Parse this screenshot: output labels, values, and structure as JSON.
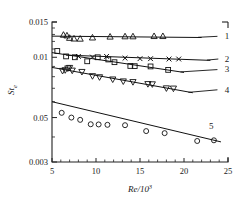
{
  "chart_data": {
    "type": "scatter",
    "title": "",
    "xlabel": "Re/10³",
    "ylabel": "St",
    "ylabel_sub": "e",
    "xlabel_base": "Re/10",
    "xlabel_exp": "3",
    "xscale": "linear",
    "yscale": "log",
    "xlim": [
      5,
      25
    ],
    "ylim": [
      0.003,
      0.015
    ],
    "grid": false,
    "legend_position": "right-inline",
    "xticks": [
      5,
      10,
      15,
      20,
      25
    ],
    "xtick_labels": [
      "5",
      "10",
      "15",
      "20",
      "25"
    ],
    "yticks": [
      0.015,
      0.01,
      0.05,
      0.003
    ],
    "ytick_labels": [
      "0.015",
      "0.01",
      "0.05",
      "0.003"
    ],
    "ytick_values": [
      0.015,
      0.01,
      0.005,
      0.003
    ],
    "yticks_minor": [
      0.014,
      0.013,
      0.012,
      0.011,
      0.009,
      0.008,
      0.007,
      0.006,
      0.004
    ],
    "series": [
      {
        "name": "1",
        "label": "1",
        "marker": "triangle-up",
        "label_x": 24.4,
        "label_y": 0.0128,
        "fit": [
          [
            5.0,
            0.01275
          ],
          [
            22.0,
            0.01255
          ]
        ],
        "leader": [
          [
            21.6,
            0.01258
          ],
          [
            23.8,
            0.01272
          ]
        ],
        "points": [
          [
            6.3,
            0.01295
          ],
          [
            6.7,
            0.01285
          ],
          [
            7.0,
            0.0125
          ],
          [
            7.5,
            0.0124
          ],
          [
            8.2,
            0.01238
          ],
          [
            9.6,
            0.01255
          ],
          [
            11.6,
            0.01268
          ],
          [
            13.3,
            0.01272
          ],
          [
            14.2,
            0.01272
          ],
          [
            16.6,
            0.01276
          ],
          [
            17.6,
            0.01276
          ]
        ]
      },
      {
        "name": "2",
        "label": "2",
        "marker": "cross",
        "label_x": 24.4,
        "label_y": 0.00985,
        "fit": [
          [
            6.6,
            0.01025
          ],
          [
            23.0,
            0.00965
          ]
        ],
        "leader": [
          [
            22.6,
            0.00968
          ],
          [
            23.9,
            0.0098
          ]
        ],
        "points": [
          [
            8.0,
            0.0101
          ],
          [
            9.6,
            0.01002
          ],
          [
            11.2,
            0.0101
          ],
          [
            13.3,
            0.0099
          ],
          [
            15.0,
            0.00984
          ],
          [
            16.2,
            0.00984
          ],
          [
            18.3,
            0.0098
          ],
          [
            19.4,
            0.0098
          ]
        ]
      },
      {
        "name": "3",
        "label": "3",
        "marker": "square",
        "label_x": 24.4,
        "label_y": 0.0087,
        "fit": [
          [
            5.0,
            0.01055
          ],
          [
            20.0,
            0.0084
          ]
        ],
        "leader": [
          [
            19.6,
            0.00845
          ],
          [
            23.8,
            0.00868
          ]
        ],
        "points": [
          [
            5.6,
            0.01075
          ],
          [
            6.6,
            0.0101
          ],
          [
            7.6,
            0.01
          ],
          [
            9.0,
            0.00955
          ],
          [
            10.2,
            0.01
          ],
          [
            11.4,
            0.00975
          ],
          [
            12.1,
            0.00945
          ],
          [
            13.9,
            0.00905
          ],
          [
            14.4,
            0.00903
          ],
          [
            16.2,
            0.009
          ],
          [
            18.2,
            0.00865
          ]
        ]
      },
      {
        "name": "4",
        "label": "4",
        "marker": "triangle-down",
        "label_x": 24.4,
        "label_y": 0.0069,
        "fit": [
          [
            5.0,
            0.0089
          ],
          [
            21.0,
            0.00665
          ]
        ],
        "leader": [
          [
            20.5,
            0.00668
          ],
          [
            23.8,
            0.00688
          ]
        ],
        "points": [
          [
            6.2,
            0.00855
          ],
          [
            6.5,
            0.00862
          ],
          [
            6.8,
            0.0088
          ],
          [
            7.0,
            0.00885
          ],
          [
            7.3,
            0.00858
          ],
          [
            8.4,
            0.00845
          ],
          [
            9.6,
            0.00805
          ],
          [
            10.4,
            0.00795
          ],
          [
            11.9,
            0.00775
          ],
          [
            13.1,
            0.00758
          ],
          [
            14.2,
            0.00752
          ],
          [
            15.9,
            0.00735
          ],
          [
            16.4,
            0.00733
          ],
          [
            18.0,
            0.007
          ],
          [
            18.8,
            0.00698
          ]
        ]
      },
      {
        "name": "5",
        "label": "5",
        "marker": "circle",
        "label_x": 22.6,
        "label_y": 0.00455,
        "fit": [
          [
            5.0,
            0.006
          ],
          [
            24.2,
            0.00378
          ]
        ],
        "leader": [],
        "points": [
          [
            6.1,
            0.00528
          ],
          [
            7.2,
            0.005
          ],
          [
            8.2,
            0.00487
          ],
          [
            9.4,
            0.00463
          ],
          [
            10.3,
            0.00462
          ],
          [
            11.3,
            0.0046
          ],
          [
            13.3,
            0.00458
          ],
          [
            15.7,
            0.00428
          ],
          [
            17.8,
            0.00418
          ],
          [
            21.5,
            0.00382
          ],
          [
            23.4,
            0.00385
          ]
        ]
      }
    ]
  },
  "axes": {
    "y_title_main": "St",
    "y_title_sub": "e",
    "x_title_main": "Re/10",
    "x_title_exp": "3"
  }
}
